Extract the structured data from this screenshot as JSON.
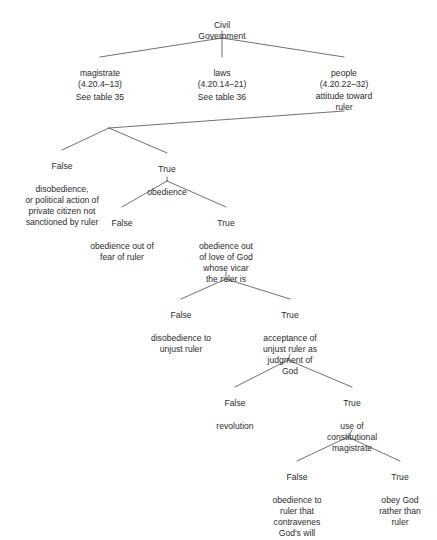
{
  "diagram": {
    "line_color": "#4a4a4a",
    "text_color": "#2b2b2b",
    "background_color": "#ffffff",
    "root": {
      "text": "Civil\nGovernment"
    },
    "level1": {
      "magistrate": {
        "text": "magistrate\n(4.20.4–13)",
        "note": "See table 35"
      },
      "laws": {
        "text": "laws\n(4.20.14–21)",
        "note": "See table 36"
      },
      "people": {
        "text": "people\n(4.20.22–32)\nattitude toward\nruler"
      }
    },
    "branches": [
      {
        "id": "false-disobedience",
        "label": "False",
        "text": "disobedience,\nor political action of\nprivate citizen not\nsanctioned by ruler"
      },
      {
        "id": "true-obedience",
        "label": "True",
        "text": "obedience"
      },
      {
        "id": "false-obedience-fear",
        "label": "False",
        "text": "obedience out of\nfear of ruler"
      },
      {
        "id": "true-obedience-love-of-god",
        "label": "True",
        "text": "obedience out\nof love of God\nwhose vicar\nthe ruler is"
      },
      {
        "id": "false-disobedience-unjust-ruler",
        "label": "False",
        "text": "disobedience to\nunjust ruler"
      },
      {
        "id": "true-acceptance-unjust-ruler",
        "label": "True",
        "text": "acceptance of\nunjust ruler as\njudgment of\nGod"
      },
      {
        "id": "false-revolution",
        "label": "False",
        "text": "revolution"
      },
      {
        "id": "true-constitutional-magistrate",
        "label": "True",
        "text": "use of\nconstitutional\nmagistrate"
      },
      {
        "id": "false-obedience-contravenes",
        "label": "False",
        "text": "obedience to\nruler that\ncontravenes\nGod's will"
      },
      {
        "id": "true-obey-god",
        "label": "True",
        "text": "obey God\nrather than\nruler"
      }
    ]
  }
}
